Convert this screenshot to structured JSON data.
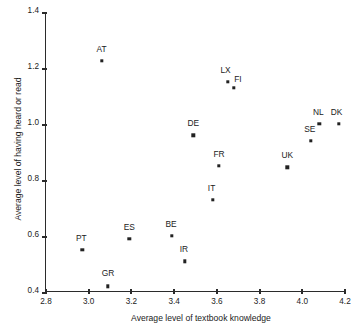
{
  "chart_data": {
    "type": "scatter",
    "title": "",
    "xlabel": "Average level of textbook knowledge",
    "ylabel": "Average level of having heard or read",
    "xlim": [
      2.8,
      4.2
    ],
    "ylim": [
      0.4,
      1.4
    ],
    "xticks": [
      "2.8",
      "3.0",
      "3.2",
      "3.4",
      "3.6",
      "3.8",
      "4.0",
      "4.2"
    ],
    "xtick_values": [
      2.8,
      3.0,
      3.2,
      3.4,
      3.6,
      3.8,
      4.0,
      4.2
    ],
    "yticks": [
      "0.4",
      "0.6",
      "0.8",
      "1.0",
      "1.2",
      "1.4"
    ],
    "ytick_values": [
      0.4,
      0.6,
      0.8,
      1.0,
      1.2,
      1.4
    ],
    "grid": false,
    "legend": "none",
    "marker": "square",
    "marker_color": "#222222",
    "points": [
      {
        "label": "AT",
        "x": 3.06,
        "y": 1.225,
        "label_dx": 0,
        "label_dy": -12
      },
      {
        "label": "LX",
        "x": 3.65,
        "y": 1.15,
        "label_dx": -2,
        "label_dy": -12
      },
      {
        "label": "FI",
        "x": 3.68,
        "y": 1.13,
        "label_dx": 4,
        "label_dy": -9
      },
      {
        "label": "DE",
        "x": 3.49,
        "y": 0.96,
        "label_dx": 0,
        "label_dy": -12
      },
      {
        "label": "NL",
        "x": 4.08,
        "y": 1.0,
        "label_dx": -1,
        "label_dy": -12
      },
      {
        "label": "DK",
        "x": 4.17,
        "y": 1.0,
        "label_dx": -2,
        "label_dy": -12
      },
      {
        "label": "SE",
        "x": 4.04,
        "y": 0.94,
        "label_dx": -1,
        "label_dy": -12
      },
      {
        "label": "FR",
        "x": 3.61,
        "y": 0.85,
        "label_dx": 0,
        "label_dy": -12
      },
      {
        "label": "UK",
        "x": 3.93,
        "y": 0.845,
        "label_dx": 0,
        "label_dy": -12
      },
      {
        "label": "IT",
        "x": 3.58,
        "y": 0.73,
        "label_dx": -1,
        "label_dy": -12
      },
      {
        "label": "BE",
        "x": 3.39,
        "y": 0.6,
        "label_dx": -1,
        "label_dy": -12
      },
      {
        "label": "ES",
        "x": 3.19,
        "y": 0.59,
        "label_dx": 0,
        "label_dy": -12
      },
      {
        "label": "IR",
        "x": 3.45,
        "y": 0.51,
        "label_dx": -1,
        "label_dy": -12
      },
      {
        "label": "PT",
        "x": 2.97,
        "y": 0.55,
        "label_dx": -1,
        "label_dy": -12
      },
      {
        "label": "GR",
        "x": 3.09,
        "y": 0.42,
        "label_dx": 0,
        "label_dy": -13
      }
    ]
  }
}
